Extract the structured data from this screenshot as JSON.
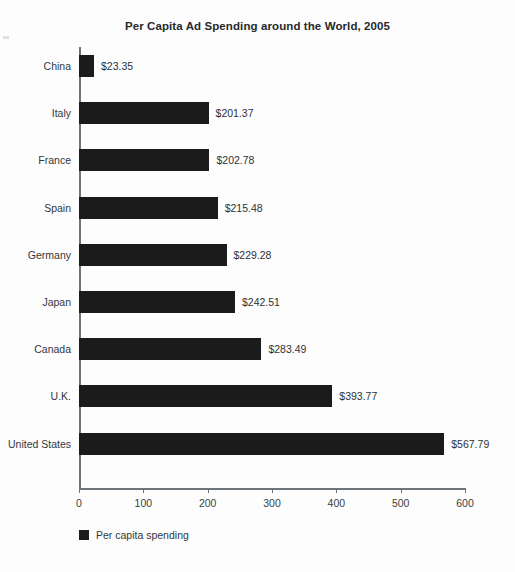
{
  "chart_data": {
    "type": "bar",
    "orientation": "horizontal",
    "title": "Per Capita Ad Spending around the World, 2005",
    "xlabel": "",
    "ylabel": "",
    "xlim": [
      0,
      600
    ],
    "xticks": [
      0,
      100,
      200,
      300,
      400,
      500,
      600
    ],
    "xtick_labels": [
      "0",
      "100",
      "200",
      "300",
      "400",
      "500",
      "600"
    ],
    "grid": false,
    "legend_position": "below-left",
    "legend": [
      "Per capita spending"
    ],
    "series": [
      {
        "name": "Per capita spending",
        "color": "#1b1b1b",
        "values": [
          23.35,
          201.37,
          202.78,
          215.48,
          229.28,
          242.51,
          283.49,
          393.77,
          567.79
        ]
      }
    ],
    "categories": [
      "China",
      "Italy",
      "France",
      "Spain",
      "Germany",
      "Japan",
      "Canada",
      "U.K.",
      "United States"
    ],
    "data_labels": [
      "$23.35",
      "$201.37",
      "$202.78",
      "$215.48",
      "$229.28",
      "$242.51",
      "$283.49",
      "$393.77",
      "$567.79"
    ],
    "points": [
      {
        "category": "China",
        "value": 23.35,
        "label": "$23.35"
      },
      {
        "category": "Italy",
        "value": 201.37,
        "label": "$201.37"
      },
      {
        "category": "France",
        "value": 202.78,
        "label": "$202.78"
      },
      {
        "category": "Spain",
        "value": 215.48,
        "label": "$215.48"
      },
      {
        "category": "Germany",
        "value": 229.28,
        "label": "$229.28"
      },
      {
        "category": "Japan",
        "value": 242.51,
        "label": "$242.51"
      },
      {
        "category": "Canada",
        "value": 283.49,
        "label": "$283.49"
      },
      {
        "category": "U.K.",
        "value": 393.77,
        "label": "$393.77"
      },
      {
        "category": "United States",
        "value": 567.79,
        "label": "$567.79"
      }
    ]
  }
}
